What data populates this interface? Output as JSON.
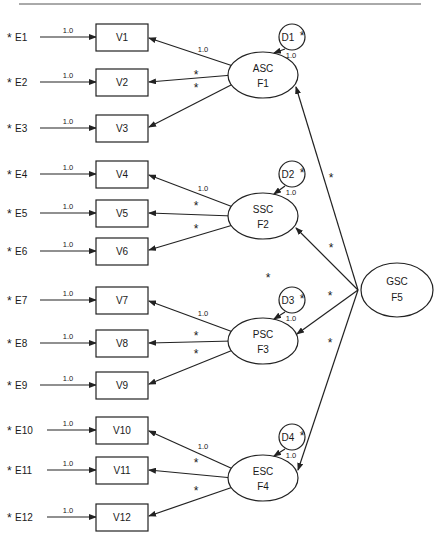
{
  "diagram": {
    "type": "structural-equation-model",
    "top_rule": true,
    "error_label": "1.0",
    "star": "*",
    "fixed_loading": "1.0",
    "factors": [
      {
        "name": "ASC",
        "id": "F1",
        "disturbance": "D1",
        "disturbance_loading": "1.0",
        "indicators": [
          {
            "var": "V1",
            "error": "E1",
            "loading": "1.0"
          },
          {
            "var": "V2",
            "error": "E2",
            "loading": "*"
          },
          {
            "var": "V3",
            "error": "E3",
            "loading": "*"
          }
        ]
      },
      {
        "name": "SSC",
        "id": "F2",
        "disturbance": "D2",
        "disturbance_loading": "1.0",
        "indicators": [
          {
            "var": "V4",
            "error": "E4",
            "loading": "1.0"
          },
          {
            "var": "V5",
            "error": "E5",
            "loading": "*"
          },
          {
            "var": "V6",
            "error": "E6",
            "loading": "*"
          }
        ]
      },
      {
        "name": "PSC",
        "id": "F3",
        "disturbance": "D3",
        "disturbance_loading": "1.0",
        "indicators": [
          {
            "var": "V7",
            "error": "E7",
            "loading": "1.0"
          },
          {
            "var": "V8",
            "error": "E8",
            "loading": "*"
          },
          {
            "var": "V9",
            "error": "E9",
            "loading": "*"
          }
        ]
      },
      {
        "name": "ESC",
        "id": "F4",
        "disturbance": "D4",
        "disturbance_loading": "1.0",
        "indicators": [
          {
            "var": "V10",
            "error": "E10",
            "loading": "1.0"
          },
          {
            "var": "V11",
            "error": "E11",
            "loading": "*"
          },
          {
            "var": "V12",
            "error": "E12",
            "loading": "*"
          }
        ]
      }
    ],
    "higher_order": {
      "name": "GSC",
      "id": "F5",
      "paths": [
        {
          "to": "F1",
          "label": "*"
        },
        {
          "to": "F2",
          "label": "*"
        },
        {
          "to": "F3",
          "label": "*"
        },
        {
          "to": "F4",
          "label": "*"
        }
      ]
    },
    "extra_star": "*"
  }
}
